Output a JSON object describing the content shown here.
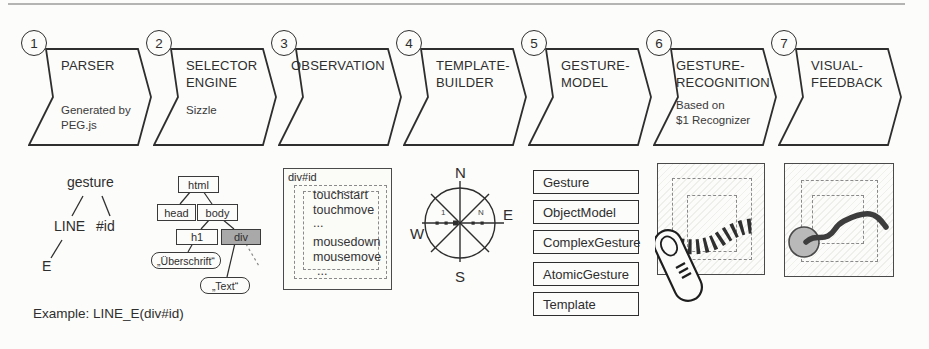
{
  "stages": [
    {
      "number": "1",
      "title": "PARSER",
      "subtitle": "Generated by\nPEG.js"
    },
    {
      "number": "2",
      "title": "SELECTOR\nENGINE",
      "subtitle": "Sizzle"
    },
    {
      "number": "3",
      "title": "OBSERVATION",
      "subtitle": ""
    },
    {
      "number": "4",
      "title": "TEMPLATE-\nBUILDER",
      "subtitle": ""
    },
    {
      "number": "5",
      "title": "GESTURE-\nMODEL",
      "subtitle": ""
    },
    {
      "number": "6",
      "title": "GESTURE-\nRECOGNITION",
      "subtitle": "Based on\n$1 Recognizer"
    },
    {
      "number": "7",
      "title": "VISUAL-\nFEEDBACK",
      "subtitle": ""
    }
  ],
  "example_caption": "Example: LINE_E(div#id)",
  "gesture_tree": {
    "root": "gesture",
    "left_child": "LINE",
    "right_child": "#id",
    "leaf": "E"
  },
  "dom_tree": {
    "html": "html",
    "head": "head",
    "body": "body",
    "h1": "h1",
    "div": "div",
    "heading_literal": "„Überschrift“",
    "text_literal": "„Text“"
  },
  "observation": {
    "target": "div#id",
    "touch_events": [
      "touchstart",
      "touchmove",
      "..."
    ],
    "mouse_events": [
      "mousedown",
      "mousemove",
      "..."
    ]
  },
  "compass": {
    "north": "N",
    "east": "E",
    "south": "S",
    "west": "W",
    "first_point": "1",
    "last_point": "N"
  },
  "model_classes": [
    "Gesture",
    "ObjectModel",
    "ComplexGesture",
    "AtomicGesture",
    "Template"
  ],
  "colors": {
    "stroke": "#2e2e2e",
    "highlight_node_fill": "#a9a9a9",
    "touch_point_fill": "#b9b9b9"
  }
}
